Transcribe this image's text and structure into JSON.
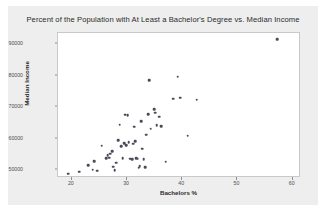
{
  "chart_data": {
    "type": "scatter",
    "title": "Percent of the Population with At Least a Bachelor's Degree vs. Median Income",
    "xlabel": "Bachelors %",
    "ylabel": "Median Income",
    "xlim": [
      17.5,
      61.5
    ],
    "ylim": [
      47500,
      93500
    ],
    "xticks": [
      20,
      30,
      40,
      50,
      60
    ],
    "yticks": [
      50000,
      60000,
      70000,
      80000,
      90000
    ],
    "xtick_labels": [
      "20",
      "30",
      "40",
      "50",
      "60"
    ],
    "ytick_labels": [
      "50000",
      "60000",
      "70000",
      "80000",
      "90000"
    ],
    "grid": false,
    "legend": false,
    "marker_color": "#4a4a58",
    "plot_bg": "#ffffff",
    "figure_bg": "#eeeeee",
    "points": [
      {
        "x": 19.4,
        "y": 48900
      },
      {
        "x": 21.3,
        "y": 49500
      },
      {
        "x": 23.0,
        "y": 51600
      },
      {
        "x": 23.8,
        "y": 50100
      },
      {
        "x": 24.1,
        "y": 52900
      },
      {
        "x": 24.6,
        "y": 49800
      },
      {
        "x": 25.4,
        "y": 57800
      },
      {
        "x": 26.2,
        "y": 53700
      },
      {
        "x": 26.5,
        "y": 54800
      },
      {
        "x": 26.8,
        "y": 53900
      },
      {
        "x": 27.0,
        "y": 55200
      },
      {
        "x": 27.3,
        "y": 56000
      },
      {
        "x": 27.5,
        "y": 51100
      },
      {
        "x": 27.8,
        "y": 49900
      },
      {
        "x": 28.0,
        "y": 52300
      },
      {
        "x": 28.4,
        "y": 59400
      },
      {
        "x": 28.7,
        "y": 64400
      },
      {
        "x": 28.9,
        "y": 57600
      },
      {
        "x": 29.2,
        "y": 53800
      },
      {
        "x": 29.5,
        "y": 58500
      },
      {
        "x": 29.7,
        "y": 67600
      },
      {
        "x": 29.9,
        "y": 57900
      },
      {
        "x": 30.1,
        "y": 67500
      },
      {
        "x": 30.3,
        "y": 58800
      },
      {
        "x": 30.6,
        "y": 53600
      },
      {
        "x": 30.9,
        "y": 53500
      },
      {
        "x": 31.1,
        "y": 58400
      },
      {
        "x": 31.3,
        "y": 63800
      },
      {
        "x": 31.5,
        "y": 59100
      },
      {
        "x": 31.7,
        "y": 53700
      },
      {
        "x": 31.9,
        "y": 53600
      },
      {
        "x": 32.1,
        "y": 50800
      },
      {
        "x": 32.3,
        "y": 51200
      },
      {
        "x": 32.6,
        "y": 65500
      },
      {
        "x": 32.8,
        "y": 56800
      },
      {
        "x": 33.0,
        "y": 53400
      },
      {
        "x": 33.3,
        "y": 50900
      },
      {
        "x": 33.5,
        "y": 61200
      },
      {
        "x": 33.8,
        "y": 67800
      },
      {
        "x": 34.0,
        "y": 78600
      },
      {
        "x": 34.3,
        "y": 63200
      },
      {
        "x": 34.9,
        "y": 69400
      },
      {
        "x": 35.1,
        "y": 68200
      },
      {
        "x": 35.4,
        "y": 64300
      },
      {
        "x": 35.8,
        "y": 67000
      },
      {
        "x": 36.2,
        "y": 63900
      },
      {
        "x": 37.0,
        "y": 52700
      },
      {
        "x": 38.4,
        "y": 72600
      },
      {
        "x": 39.2,
        "y": 79600
      },
      {
        "x": 39.6,
        "y": 73000
      },
      {
        "x": 41.0,
        "y": 60900
      },
      {
        "x": 42.6,
        "y": 72300
      },
      {
        "x": 57.2,
        "y": 91600
      }
    ]
  }
}
